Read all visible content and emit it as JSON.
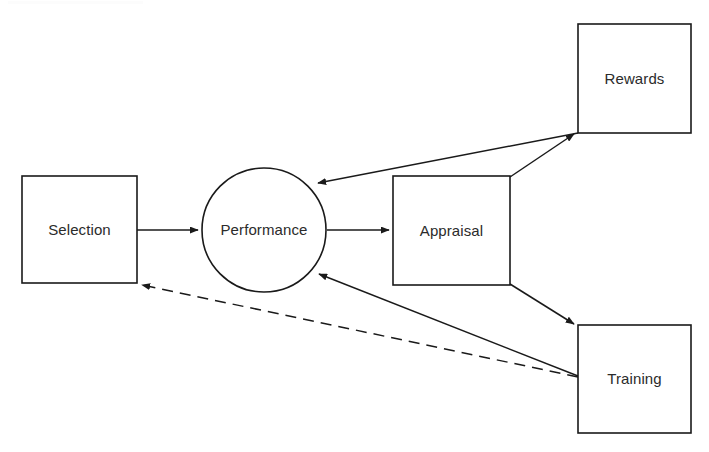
{
  "diagram": {
    "background_color": "#ffffff",
    "stroke_color": "#1a1a1a",
    "text_color": "#2b2b2b",
    "nodes": [
      {
        "id": "selection",
        "label": "Selection",
        "shape": "rectangle",
        "x": 22,
        "y": 176,
        "width": 115,
        "height": 107,
        "cx": 79.5,
        "cy": 230
      },
      {
        "id": "performance",
        "label": "Performance",
        "shape": "circle",
        "cx": 264,
        "cy": 230,
        "r": 62
      },
      {
        "id": "appraisal",
        "label": "Appraisal",
        "shape": "rectangle",
        "x": 393,
        "y": 176,
        "width": 117,
        "height": 109,
        "cx": 451.5,
        "cy": 231
      },
      {
        "id": "rewards",
        "label": "Rewards",
        "shape": "rectangle",
        "x": 578,
        "y": 24,
        "width": 113,
        "height": 109,
        "cx": 634.5,
        "cy": 79
      },
      {
        "id": "training",
        "label": "Training",
        "shape": "rectangle",
        "x": 578,
        "y": 325,
        "width": 113,
        "height": 108,
        "cx": 634.5,
        "cy": 379
      }
    ],
    "edges": [
      {
        "id": "selection-to-performance",
        "from": "selection",
        "to": "performance",
        "style": "solid",
        "arrow": "end",
        "points": "137,230 198,230"
      },
      {
        "id": "performance-to-appraisal",
        "from": "performance",
        "to": "appraisal",
        "style": "solid",
        "arrow": "end",
        "points": "327,230 389,230"
      },
      {
        "id": "appraisal-to-rewards",
        "from": "appraisal",
        "to": "rewards",
        "style": "solid",
        "arrow": "end",
        "points": "510,177 574,134"
      },
      {
        "id": "appraisal-to-training",
        "from": "appraisal",
        "to": "training",
        "style": "solid",
        "arrow": "end",
        "points": "510,284 574,324"
      },
      {
        "id": "rewards-to-performance",
        "from": "rewards",
        "to": "performance",
        "style": "solid",
        "arrow": "end",
        "points": "578,133 318,183"
      },
      {
        "id": "training-to-performance",
        "from": "training",
        "to": "performance",
        "style": "solid",
        "arrow": "end",
        "points": "578,376 319,274"
      },
      {
        "id": "training-to-selection",
        "from": "training",
        "to": "selection",
        "style": "dashed",
        "arrow": "end",
        "points": "578,377 142,285"
      }
    ]
  }
}
